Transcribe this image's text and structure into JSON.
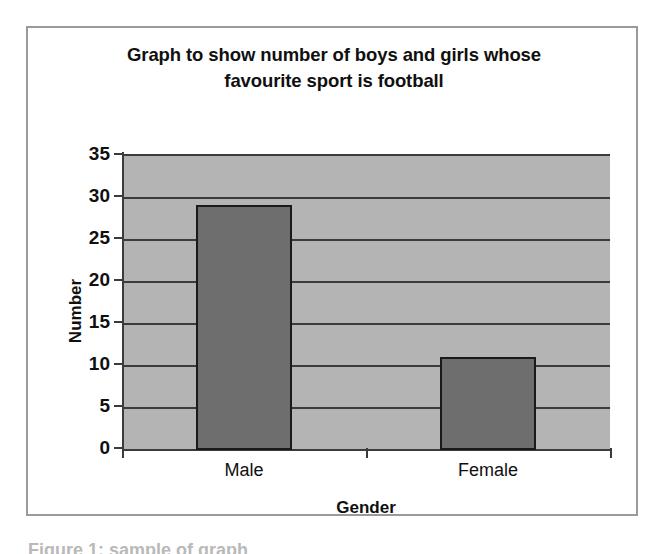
{
  "figure": {
    "caption_partial": "Figure 1: sample of graph",
    "border_color": "#9a9a9a",
    "background_color": "#ffffff"
  },
  "chart_data": {
    "type": "bar",
    "title": "Graph to show number of boys and girls whose favourite sport is football",
    "title_lines": [
      "Graph to show number of boys and girls whose",
      "favourite sport is football"
    ],
    "categories": [
      "Male",
      "Female"
    ],
    "values": [
      29,
      11
    ],
    "xlabel": "Gender",
    "ylabel": "Number",
    "ylim": [
      0,
      35
    ],
    "ytick_step": 5,
    "yticks": [
      35,
      30,
      25,
      20,
      15,
      10,
      5,
      0
    ],
    "ytick_labels": [
      "35",
      "30",
      "25",
      "20",
      "15",
      "10",
      "5",
      "0"
    ],
    "grid": true,
    "grid_axis": "y",
    "legend": false,
    "series": [
      {
        "name": "Number",
        "values": [
          29,
          11
        ],
        "bar_color": "#6e6e6e",
        "bar_border_color": "#1a1a1a"
      }
    ],
    "plot_background_color": "#b4b4b4",
    "axis_color": "#3b3b3b",
    "text_color": "#101010"
  }
}
